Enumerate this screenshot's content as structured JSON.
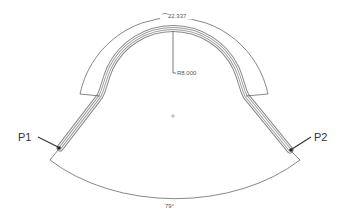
{
  "drawing": {
    "arc_length_dimension": "⌒22.337",
    "radius_dimension": "R8.000",
    "angle_dimension": "79°",
    "point_labels": {
      "p1": "P1",
      "p2": "P2"
    }
  },
  "colors": {
    "background": "#ffffff",
    "tube": "#8a8a8a",
    "dimension": "#555555",
    "label": "#333333"
  }
}
